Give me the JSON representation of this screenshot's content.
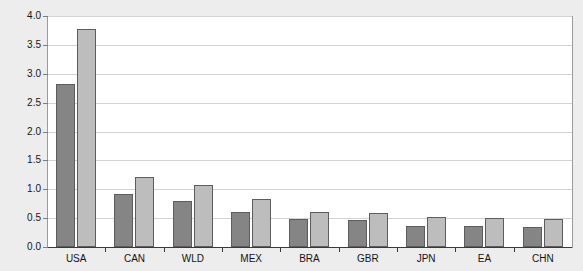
{
  "chart_data": {
    "type": "bar",
    "title": "",
    "subtitle": "",
    "xlabel": "",
    "ylabel": "",
    "ylim": [
      0.0,
      4.0
    ],
    "ytick_labels": [
      "0.0",
      "0.5",
      "1.0",
      "1.5",
      "2.0",
      "2.5",
      "3.0",
      "3.5",
      "4.0"
    ],
    "ytick_values": [
      0.0,
      0.5,
      1.0,
      1.5,
      2.0,
      2.5,
      3.0,
      3.5,
      4.0
    ],
    "grid": true,
    "legend_position": "top-inside",
    "categories": [
      "USA",
      "CAN",
      "WLD",
      "MEX",
      "BRA",
      "GBR",
      "JPN",
      "EA",
      "CHN"
    ],
    "series": [
      {
        "name": "Forward-looking consumers",
        "color": "#858585",
        "values": [
          2.83,
          0.92,
          0.79,
          0.6,
          0.49,
          0.46,
          0.37,
          0.37,
          0.35
        ]
      },
      {
        "name": "Backward-looking consumers",
        "color": "#bdbdbd",
        "values": [
          3.77,
          1.21,
          1.08,
          0.84,
          0.61,
          0.59,
          0.52,
          0.5,
          0.48
        ]
      }
    ]
  },
  "legend": {
    "items": [
      {
        "label": "Forward-looking consumers",
        "color": "#858585"
      },
      {
        "label": "Backward-looking consumers",
        "color": "#bdbdbd"
      }
    ]
  },
  "colors": {
    "forward": "#858585",
    "backward": "#bdbdbd",
    "plot_background": "#ffffff",
    "page_background": "#ededed",
    "gridline": "#d2d2d2",
    "axis": "#3a3a3a"
  }
}
